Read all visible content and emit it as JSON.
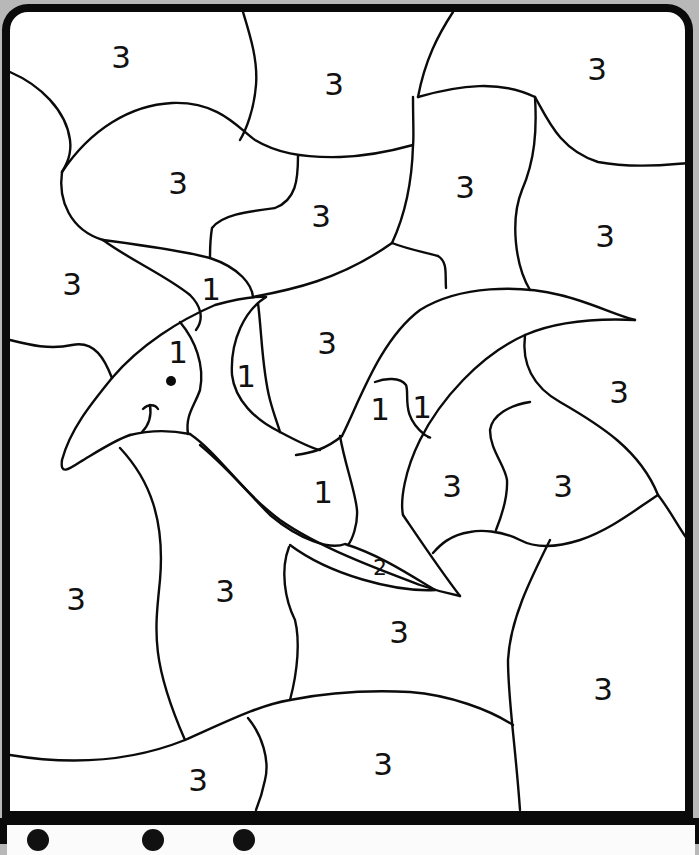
{
  "page": {
    "type": "color-by-number",
    "colors": {
      "frame": "#0a0a0a",
      "paper": "#ffffff",
      "background": "#b8b8b8",
      "line": "#0b0b0b"
    }
  },
  "regions": [
    {
      "id": "r1",
      "label": "3",
      "x": 121,
      "y": 57,
      "size": "big"
    },
    {
      "id": "r2",
      "label": "3",
      "x": 334,
      "y": 84,
      "size": "big"
    },
    {
      "id": "r3",
      "label": "3",
      "x": 597,
      "y": 69,
      "size": "big"
    },
    {
      "id": "r4",
      "label": "3",
      "x": 178,
      "y": 183,
      "size": "big"
    },
    {
      "id": "r5",
      "label": "3",
      "x": 321,
      "y": 216,
      "size": "big"
    },
    {
      "id": "r6",
      "label": "3",
      "x": 465,
      "y": 187,
      "size": "big"
    },
    {
      "id": "r7",
      "label": "3",
      "x": 605,
      "y": 236,
      "size": "big"
    },
    {
      "id": "r8",
      "label": "3",
      "x": 72,
      "y": 284,
      "size": "big"
    },
    {
      "id": "r9",
      "label": "1",
      "x": 211,
      "y": 289,
      "size": "big"
    },
    {
      "id": "r10",
      "label": "1",
      "x": 178,
      "y": 352,
      "size": "big"
    },
    {
      "id": "r11",
      "label": "1",
      "x": 246,
      "y": 376,
      "size": "big"
    },
    {
      "id": "r12",
      "label": "3",
      "x": 327,
      "y": 343,
      "size": "big"
    },
    {
      "id": "r13",
      "label": "1",
      "x": 380,
      "y": 409,
      "size": "big"
    },
    {
      "id": "r14",
      "label": "1",
      "x": 422,
      "y": 407,
      "size": "big"
    },
    {
      "id": "r15",
      "label": "3",
      "x": 619,
      "y": 392,
      "size": "big"
    },
    {
      "id": "r16",
      "label": "1",
      "x": 323,
      "y": 492,
      "size": "big"
    },
    {
      "id": "r17",
      "label": "3",
      "x": 452,
      "y": 486,
      "size": "big"
    },
    {
      "id": "r18",
      "label": "3",
      "x": 563,
      "y": 486,
      "size": "big"
    },
    {
      "id": "r19",
      "label": "2",
      "x": 380,
      "y": 568,
      "size": "small"
    },
    {
      "id": "r20",
      "label": "3",
      "x": 76,
      "y": 599,
      "size": "big"
    },
    {
      "id": "r21",
      "label": "3",
      "x": 225,
      "y": 591,
      "size": "big"
    },
    {
      "id": "r22",
      "label": "3",
      "x": 399,
      "y": 632,
      "size": "big"
    },
    {
      "id": "r23",
      "label": "3",
      "x": 603,
      "y": 689,
      "size": "big"
    },
    {
      "id": "r24",
      "label": "3",
      "x": 383,
      "y": 764,
      "size": "big"
    },
    {
      "id": "r25",
      "label": "3",
      "x": 198,
      "y": 780,
      "size": "big"
    }
  ],
  "legend": {
    "items": [
      {
        "number": "1",
        "x": 40,
        "text": "..."
      },
      {
        "number": "2",
        "x": 155,
        "text": "..."
      },
      {
        "number": "3",
        "x": 245,
        "text": "..."
      }
    ]
  }
}
